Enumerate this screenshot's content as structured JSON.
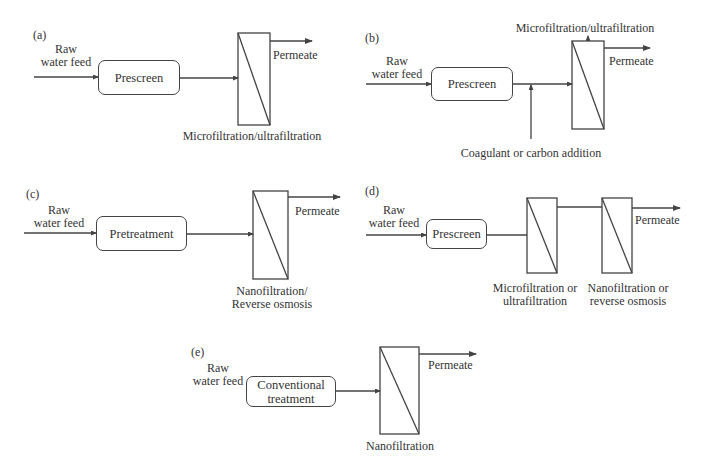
{
  "diagram": {
    "type": "membrane process flow schematics",
    "line_color": "#444444",
    "panels": [
      {
        "id": "a",
        "label": "(a)",
        "feed_label_line1": "Raw",
        "feed_label_line2": "water feed",
        "pretreatment": "Prescreen",
        "membranes": [
          "Microfiltration/ultrafiltration"
        ],
        "output": "Permeate"
      },
      {
        "id": "b",
        "label": "(b)",
        "feed_label_line1": "Raw",
        "feed_label_line2": "water feed",
        "pretreatment": "Prescreen",
        "addition": "Coagulant or carbon addition",
        "membranes": [
          "Microfiltration/ultrafiltration"
        ],
        "output": "Permeate"
      },
      {
        "id": "c",
        "label": "(c)",
        "feed_label_line1": "Raw",
        "feed_label_line2": "water feed",
        "pretreatment": "Pretreatment",
        "membranes": [
          "Nanofiltration/ Reverse osmosis"
        ],
        "membrane_label_line1": "Nanofiltration/",
        "membrane_label_line2": "Reverse osmosis",
        "output": "Permeate"
      },
      {
        "id": "d",
        "label": "(d)",
        "feed_label_line1": "Raw",
        "feed_label_line2": "water feed",
        "pretreatment": "Prescreen",
        "membranes": [
          "Microfiltration or ultrafiltration",
          "Nanofiltration or reverse osmosis"
        ],
        "membrane1_label_line1": "Microfiltration or",
        "membrane1_label_line2": "ultrafiltration",
        "membrane2_label_line1": "Nanofiltration or",
        "membrane2_label_line2": "reverse osmosis",
        "output": "Permeate"
      },
      {
        "id": "e",
        "label": "(e)",
        "feed_label_line1": "Raw",
        "feed_label_line2": "water feed",
        "pretreatment": "Conventional\ntreatment",
        "membranes": [
          "Nanofiltration"
        ],
        "output": "Permeate"
      }
    ]
  }
}
